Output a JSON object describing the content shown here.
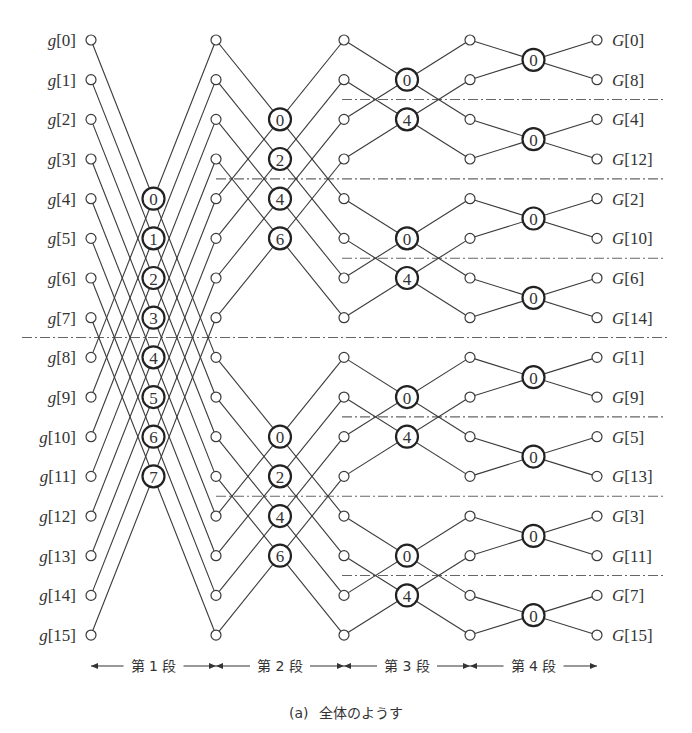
{
  "diagram": {
    "caption_prefix": "(a)",
    "caption_text": "全体のようす",
    "inputs": [
      "g[0]",
      "g[1]",
      "g[2]",
      "g[3]",
      "g[4]",
      "g[5]",
      "g[6]",
      "g[7]",
      "g[8]",
      "g[9]",
      "g[10]",
      "g[11]",
      "g[12]",
      "g[13]",
      "g[14]",
      "g[15]"
    ],
    "outputs": [
      "G[0]",
      "G[8]",
      "G[4]",
      "G[12]",
      "G[2]",
      "G[10]",
      "G[6]",
      "G[14]",
      "G[1]",
      "G[9]",
      "G[5]",
      "G[13]",
      "G[3]",
      "G[11]",
      "G[7]",
      "G[15]"
    ],
    "stages": [
      {
        "label": "第 1 段",
        "span": 8,
        "twiddles": [
          "0",
          "1",
          "2",
          "3",
          "4",
          "5",
          "6",
          "7"
        ]
      },
      {
        "label": "第 2 段",
        "span": 4,
        "twiddles": [
          "0",
          "2",
          "4",
          "6"
        ]
      },
      {
        "label": "第 3 段",
        "span": 2,
        "twiddles": [
          "0",
          "4"
        ]
      },
      {
        "label": "第 4 段",
        "span": 1,
        "twiddles": [
          "0"
        ]
      }
    ],
    "layout": {
      "columns_x": [
        91,
        216,
        344,
        470,
        597
      ],
      "row_y0": 40,
      "row_dy": 39.67,
      "node_r": 5,
      "bfly_r": 11,
      "colors": {
        "line": "#3a3a3a",
        "separator": "#666666",
        "text": "#333333"
      }
    }
  }
}
